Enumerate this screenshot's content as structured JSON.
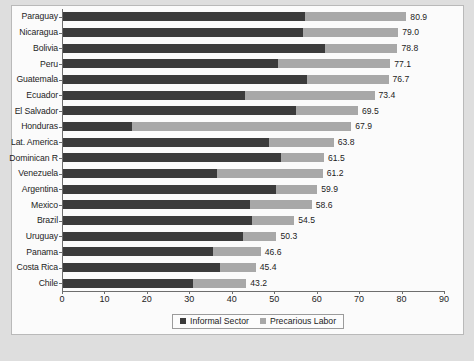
{
  "chart_data": {
    "type": "bar",
    "subtype": "stacked-horizontal",
    "title": "",
    "xlabel": "",
    "ylabel": "",
    "xlim": [
      0,
      90
    ],
    "xticks": [
      0,
      10,
      20,
      30,
      40,
      50,
      60,
      70,
      80,
      90
    ],
    "grid": false,
    "legend_position": "bottom-center",
    "categories": [
      "Paraguay",
      "Nicaragua",
      "Bolivia",
      "Peru",
      "Guatemala",
      "Ecuador",
      "El Salvador",
      "Honduras",
      "Lat. America",
      "Dominican R",
      "Venezuela",
      "Argentina",
      "Mexico",
      "Brazil",
      "Uruguay",
      "Panama",
      "Costa Rica",
      "Chile"
    ],
    "series": [
      {
        "name": "Informal Sector",
        "color": "#3b3b3b",
        "values": [
          57.0,
          56.6,
          61.7,
          50.6,
          57.5,
          42.9,
          55.0,
          16.2,
          48.6,
          51.3,
          36.4,
          50.2,
          44.1,
          44.6,
          42.4,
          35.4,
          37.1,
          30.6
        ]
      },
      {
        "name": "Precarious Labor",
        "color": "#a8a8a8",
        "values": [
          23.9,
          22.4,
          17.1,
          26.5,
          19.2,
          30.5,
          14.5,
          51.7,
          15.2,
          10.2,
          24.8,
          9.7,
          14.5,
          9.9,
          7.9,
          11.2,
          8.3,
          12.6
        ]
      }
    ],
    "totals": [
      80.9,
      79.0,
      78.8,
      77.1,
      76.7,
      73.4,
      69.5,
      67.9,
      63.8,
      61.5,
      61.2,
      59.9,
      58.6,
      54.5,
      50.3,
      46.6,
      45.4,
      43.2
    ],
    "total_labels": [
      "80.9",
      "79.0",
      "78.8",
      "77.1",
      "76.7",
      "73.4",
      "69.5",
      "67.9",
      "63.8",
      "61.5",
      "61.2",
      "59.9",
      "58.6",
      "54.5",
      "50.3",
      "46.6",
      "45.4",
      "43.2"
    ],
    "xtick_labels": [
      "0",
      "10",
      "20",
      "30",
      "40",
      "50",
      "60",
      "70",
      "80",
      "90"
    ]
  },
  "legend": {
    "items": [
      {
        "label": "Informal Sector",
        "swatch": "#3b3b3b"
      },
      {
        "label": "Precarious Labor",
        "swatch": "#a8a8a8"
      }
    ]
  },
  "colors": {
    "informal_sector": "#3b3b3b",
    "precarious_labor": "#a8a8a8",
    "plot_background": "#fbfbfb",
    "page_background": "#dedede",
    "axis": "#6e6e6e"
  }
}
